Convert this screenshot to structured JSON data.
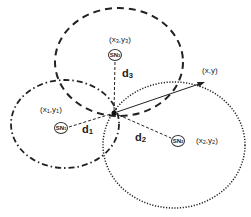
{
  "diagram": {
    "type": "trilateration",
    "colors": {
      "stroke": "#222222",
      "background": "#ffffff"
    },
    "nodes": [
      {
        "id": "SN1",
        "label": "SN",
        "sub": "1",
        "coord_label": "(x",
        "coord_sub1": "1",
        "coord_mid": ",y",
        "coord_sub2": "1",
        "coord_end": ")",
        "circle_style": "dash-dot"
      },
      {
        "id": "SN2",
        "label": "SN",
        "sub": "2",
        "coord_label": "(x",
        "coord_sub1": "2",
        "coord_mid": ",y",
        "coord_sub2": "2",
        "coord_end": ")",
        "circle_style": "dotted"
      },
      {
        "id": "SN3",
        "label": "SN",
        "sub": "3",
        "coord_label": "(x",
        "coord_sub1": "3",
        "coord_mid": ",y",
        "coord_sub2": "3",
        "coord_end": ")",
        "circle_style": "dashed"
      }
    ],
    "distances": [
      {
        "label": "d",
        "sub": "1"
      },
      {
        "label": "d",
        "sub": "2"
      },
      {
        "label": "d",
        "sub": "3"
      }
    ],
    "target": {
      "label": "(x,y)"
    }
  }
}
